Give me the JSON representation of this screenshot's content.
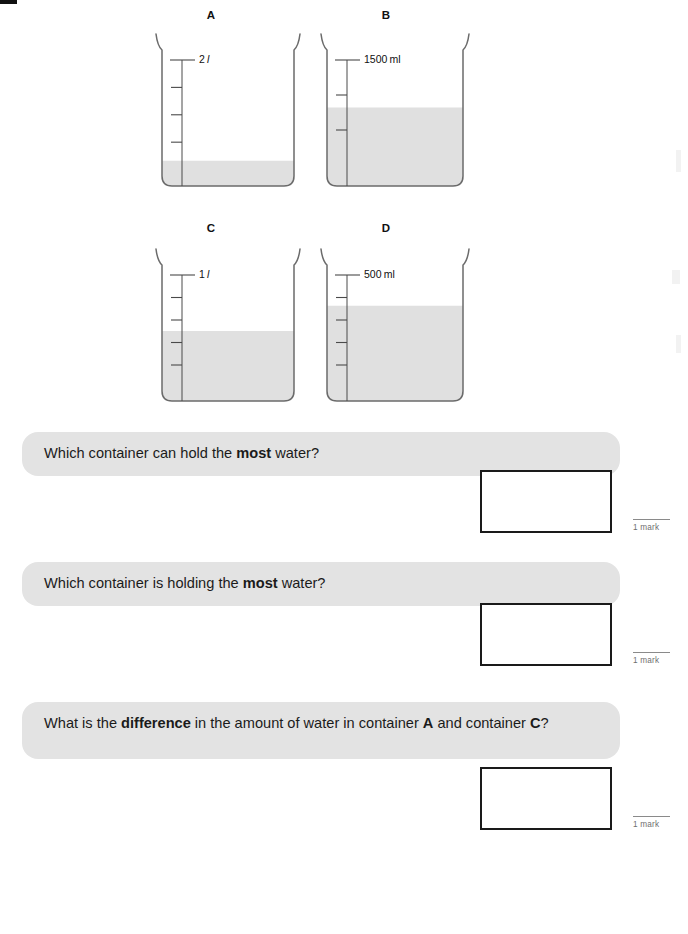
{
  "page": {
    "width": 688,
    "height": 934,
    "background": "#ffffff",
    "banner_color": "#e3e3e3",
    "water_color": "#e0e0e0",
    "outline_color": "#6b6b6b",
    "box_border_color": "#1a1a1a"
  },
  "containers": [
    {
      "id": "A",
      "label": "A",
      "scale_label": "2",
      "scale_unit": "l",
      "scale_unit_italic": true,
      "fill_fraction": 0.18,
      "tick_count": 4,
      "capacity_text": "2 l"
    },
    {
      "id": "B",
      "label": "B",
      "scale_label": "1500",
      "scale_unit": "ml",
      "scale_unit_italic": false,
      "fill_fraction": 0.56,
      "tick_count": 3,
      "capacity_text": "1500 ml"
    },
    {
      "id": "C",
      "label": "C",
      "scale_label": "1",
      "scale_unit": "l",
      "scale_unit_italic": true,
      "fill_fraction": 0.5,
      "tick_count": 5,
      "capacity_text": "1 l"
    },
    {
      "id": "D",
      "label": "D",
      "scale_label": "500",
      "scale_unit": "ml",
      "scale_unit_italic": false,
      "fill_fraction": 0.68,
      "tick_count": 5,
      "capacity_text": "500 ml"
    }
  ],
  "questions": [
    {
      "id": "q1",
      "parts": [
        {
          "text": "Which container can hold the ",
          "bold": false
        },
        {
          "text": "most",
          "bold": true
        },
        {
          "text": " water?",
          "bold": false
        }
      ],
      "plain": "Which container can hold the most water?",
      "answer_value": "",
      "mark_label": "1 mark"
    },
    {
      "id": "q2",
      "parts": [
        {
          "text": "Which container is holding the ",
          "bold": false
        },
        {
          "text": "most",
          "bold": true
        },
        {
          "text": " water?",
          "bold": false
        }
      ],
      "plain": "Which container is holding the most water?",
      "answer_value": "",
      "mark_label": "1 mark"
    },
    {
      "id": "q3",
      "parts": [
        {
          "text": "What is the ",
          "bold": false
        },
        {
          "text": "difference",
          "bold": true
        },
        {
          "text": " in the amount of water in container ",
          "bold": false
        },
        {
          "text": "A",
          "bold": true
        },
        {
          "text": " and container ",
          "bold": false
        },
        {
          "text": "C",
          "bold": true
        },
        {
          "text": "?",
          "bold": false
        }
      ],
      "plain": "What is the difference in the amount of water in container A and container C?",
      "answer_value": "",
      "mark_label": "1 mark"
    }
  ]
}
